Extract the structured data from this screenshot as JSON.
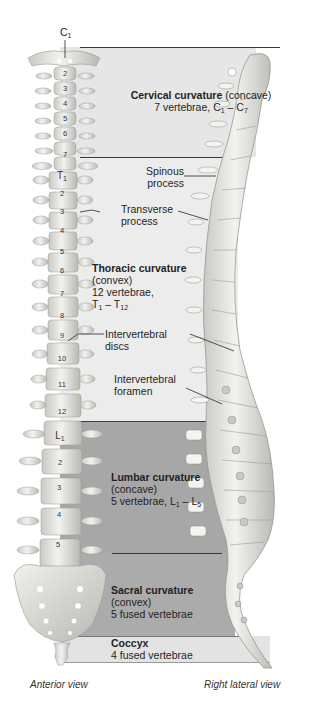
{
  "top_label": {
    "main": "C",
    "sub": "1"
  },
  "regions": [
    {
      "id": "cervical",
      "title": "Cervical curvature",
      "shape": "(concave)",
      "count_prefix": "7 vertebrae, ",
      "range_start": {
        "letter": "C",
        "num": "1"
      },
      "range_end": {
        "letter": "C",
        "num": "7"
      },
      "fill": "#e6e6e6"
    },
    {
      "id": "thoracic",
      "title": "Thoracic curvature",
      "shape": "(convex)",
      "count_prefix": "12 vertebrae,",
      "range_start": {
        "letter": "T",
        "num": "1"
      },
      "range_end": {
        "letter": "T",
        "num": "12"
      },
      "fill": "#ebebeb"
    },
    {
      "id": "lumbar",
      "title": "Lumbar curvature",
      "shape": "(concave)",
      "count_prefix": "5 vertebrae, ",
      "range_start": {
        "letter": "L",
        "num": "1"
      },
      "range_end": {
        "letter": "L",
        "num": "5"
      },
      "fill": "#a6a6a6"
    },
    {
      "id": "sacral",
      "title": "Sacral curvature",
      "shape": "(convex)",
      "count_prefix": "5 fused vertebrae",
      "fill": "#a9a9a9"
    },
    {
      "id": "coccyx",
      "title": "Coccyx",
      "count_prefix": "4 fused vertebrae",
      "fill": "#e2e2e2"
    }
  ],
  "callouts": {
    "spinous": [
      "Spinous",
      "process"
    ],
    "transverse": [
      "Transverse",
      "process"
    ],
    "discs": [
      "Intervertebral",
      "discs"
    ],
    "foramen": [
      "Intervertebral",
      "foramen"
    ]
  },
  "vertebra_labels": {
    "cervical": [
      "2",
      "3",
      "4",
      "5",
      "6",
      "7"
    ],
    "thoracic_first": {
      "letter": "T",
      "num": "1"
    },
    "thoracic": [
      "2",
      "3",
      "4",
      "5",
      "6",
      "7",
      "8",
      "9",
      "10",
      "11",
      "12"
    ],
    "lumbar_first": {
      "letter": "L",
      "num": "1"
    },
    "lumbar": [
      "2",
      "3",
      "4",
      "5"
    ]
  },
  "captions": {
    "left": "Anterior view",
    "right": "Right lateral view"
  },
  "colors": {
    "bone": "#e9e9e6",
    "bone_shadow": "#b5b5b0",
    "line": "#2a2a2a"
  }
}
